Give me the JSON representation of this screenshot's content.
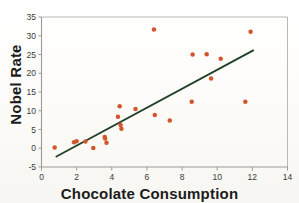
{
  "chart_data": {
    "type": "scatter",
    "title": "",
    "xlabel": "Chocolate Consumption",
    "ylabel": "Nobel Rate",
    "xlim": [
      0,
      14
    ],
    "ylim": [
      -5,
      35
    ],
    "xticks": [
      0,
      2,
      4,
      6,
      8,
      10,
      12,
      14
    ],
    "yticks": [
      -5,
      0,
      5,
      10,
      15,
      20,
      25,
      30,
      35
    ],
    "grid": false,
    "legend": null,
    "marker_color": "#d4552b",
    "line_color": "#1f4025",
    "axis_color": "#9a9a96",
    "points": [
      {
        "x": 0.75,
        "y": 0.2
      },
      {
        "x": 1.85,
        "y": 1.6
      },
      {
        "x": 2.0,
        "y": 1.9
      },
      {
        "x": 2.5,
        "y": 1.8
      },
      {
        "x": 2.95,
        "y": 0.1
      },
      {
        "x": 3.6,
        "y": 3.0
      },
      {
        "x": 3.62,
        "y": 2.6
      },
      {
        "x": 3.7,
        "y": 1.5
      },
      {
        "x": 4.35,
        "y": 8.4
      },
      {
        "x": 4.45,
        "y": 11.2
      },
      {
        "x": 4.5,
        "y": 6.2
      },
      {
        "x": 4.55,
        "y": 5.2
      },
      {
        "x": 5.35,
        "y": 10.5
      },
      {
        "x": 6.4,
        "y": 31.7
      },
      {
        "x": 6.45,
        "y": 8.9
      },
      {
        "x": 7.3,
        "y": 7.4
      },
      {
        "x": 8.55,
        "y": 12.4
      },
      {
        "x": 8.6,
        "y": 25.0
      },
      {
        "x": 9.4,
        "y": 25.1
      },
      {
        "x": 9.65,
        "y": 18.6
      },
      {
        "x": 10.2,
        "y": 23.9
      },
      {
        "x": 11.6,
        "y": 12.4
      },
      {
        "x": 11.9,
        "y": 31.1
      }
    ],
    "trendline": {
      "x_start": 0.85,
      "y_start": -2.2,
      "x_end": 12.05,
      "y_end": 26.1
    }
  }
}
